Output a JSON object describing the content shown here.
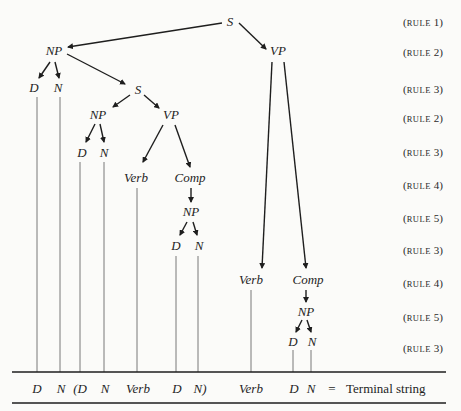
{
  "diagram": {
    "type": "phrase-structure-tree",
    "nodes": [
      {
        "id": "s1",
        "label": "S",
        "x": 230,
        "y": 22
      },
      {
        "id": "np1",
        "label": "NP",
        "x": 54,
        "y": 51
      },
      {
        "id": "vp1",
        "label": "VP",
        "x": 278,
        "y": 51
      },
      {
        "id": "d1",
        "label": "D",
        "x": 34,
        "y": 88
      },
      {
        "id": "n1",
        "label": "N",
        "x": 58,
        "y": 88
      },
      {
        "id": "s2",
        "label": "S",
        "x": 138,
        "y": 90
      },
      {
        "id": "np2",
        "label": "NP",
        "x": 98,
        "y": 115
      },
      {
        "id": "vp2",
        "label": "VP",
        "x": 171,
        "y": 115
      },
      {
        "id": "d2",
        "label": "D",
        "x": 82,
        "y": 153
      },
      {
        "id": "n2",
        "label": "N",
        "x": 104,
        "y": 153
      },
      {
        "id": "verb1",
        "label": "Verb",
        "x": 136,
        "y": 178
      },
      {
        "id": "comp1",
        "label": "Comp",
        "x": 190,
        "y": 178
      },
      {
        "id": "np3",
        "label": "NP",
        "x": 191,
        "y": 212
      },
      {
        "id": "d3",
        "label": "D",
        "x": 176,
        "y": 246
      },
      {
        "id": "n3",
        "label": "N",
        "x": 199,
        "y": 246
      },
      {
        "id": "verb2",
        "label": "Verb",
        "x": 251,
        "y": 280
      },
      {
        "id": "comp2",
        "label": "Comp",
        "x": 308,
        "y": 280
      },
      {
        "id": "np4",
        "label": "NP",
        "x": 306,
        "y": 312
      },
      {
        "id": "d4",
        "label": "D",
        "x": 293,
        "y": 342
      },
      {
        "id": "n4",
        "label": "N",
        "x": 312,
        "y": 342
      }
    ],
    "arrows": [
      {
        "from": "s1",
        "to": "np1",
        "x1": 222,
        "y1": 23,
        "x2": 68,
        "y2": 47
      },
      {
        "from": "s1",
        "to": "vp1",
        "x1": 239,
        "y1": 23,
        "x2": 266,
        "y2": 49
      },
      {
        "from": "np1",
        "to": "d1",
        "x1": 50,
        "y1": 62,
        "x2": 39,
        "y2": 78
      },
      {
        "from": "np1",
        "to": "n1",
        "x1": 55,
        "y1": 62,
        "x2": 59,
        "y2": 78
      },
      {
        "from": "np1",
        "to": "s2",
        "x1": 67,
        "y1": 54,
        "x2": 125,
        "y2": 84
      },
      {
        "from": "s2",
        "to": "np2",
        "x1": 130,
        "y1": 95,
        "x2": 113,
        "y2": 107
      },
      {
        "from": "s2",
        "to": "vp2",
        "x1": 144,
        "y1": 95,
        "x2": 159,
        "y2": 108
      },
      {
        "from": "np2",
        "to": "d2",
        "x1": 95,
        "y1": 124,
        "x2": 86,
        "y2": 142
      },
      {
        "from": "np2",
        "to": "n2",
        "x1": 100,
        "y1": 124,
        "x2": 104,
        "y2": 142
      },
      {
        "from": "vp2",
        "to": "verb1",
        "x1": 163,
        "y1": 125,
        "x2": 143,
        "y2": 162
      },
      {
        "from": "vp2",
        "to": "comp1",
        "x1": 175,
        "y1": 125,
        "x2": 190,
        "y2": 167
      },
      {
        "from": "comp1",
        "to": "np3",
        "x1": 191,
        "y1": 188,
        "x2": 191,
        "y2": 202
      },
      {
        "from": "np3",
        "to": "d3",
        "x1": 187,
        "y1": 222,
        "x2": 180,
        "y2": 235
      },
      {
        "from": "np3",
        "to": "n3",
        "x1": 193,
        "y1": 222,
        "x2": 197,
        "y2": 235
      },
      {
        "from": "vp1",
        "to": "verb2",
        "x1": 272,
        "y1": 62,
        "x2": 262,
        "y2": 268
      },
      {
        "from": "vp1",
        "to": "comp2",
        "x1": 284,
        "y1": 62,
        "x2": 306,
        "y2": 268
      },
      {
        "from": "comp2",
        "to": "np4",
        "x1": 306,
        "y1": 290,
        "x2": 306,
        "y2": 302
      },
      {
        "from": "np4",
        "to": "d4",
        "x1": 302,
        "y1": 320,
        "x2": 296,
        "y2": 332
      },
      {
        "from": "np4",
        "to": "n4",
        "x1": 307,
        "y1": 320,
        "x2": 311,
        "y2": 332
      }
    ],
    "drop_lines": [
      {
        "x": 37,
        "y1": 97,
        "y2": 372
      },
      {
        "x": 60,
        "y1": 97,
        "y2": 372
      },
      {
        "x": 80,
        "y1": 162,
        "y2": 372
      },
      {
        "x": 104,
        "y1": 162,
        "y2": 372
      },
      {
        "x": 137,
        "y1": 188,
        "y2": 372
      },
      {
        "x": 176,
        "y1": 256,
        "y2": 372
      },
      {
        "x": 198,
        "y1": 256,
        "y2": 372
      },
      {
        "x": 251,
        "y1": 290,
        "y2": 372
      },
      {
        "x": 293,
        "y1": 350,
        "y2": 372
      },
      {
        "x": 311,
        "y1": 350,
        "y2": 372
      }
    ],
    "rules": [
      {
        "label": "(RULE 1)",
        "y": 22
      },
      {
        "label": "(RULE 2)",
        "y": 52
      },
      {
        "label": "(RULE 3)",
        "y": 89
      },
      {
        "label": "(RULE 2)",
        "y": 118
      },
      {
        "label": "(RULE 3)",
        "y": 152
      },
      {
        "label": "(RULE 4)",
        "y": 185
      },
      {
        "label": "(RULE 5)",
        "y": 218
      },
      {
        "label": "(RULE 3)",
        "y": 250
      },
      {
        "label": "(RULE 4)",
        "y": 283
      },
      {
        "label": "(RULE 5)",
        "y": 317
      },
      {
        "label": "(RULE 3)",
        "y": 348
      }
    ],
    "terminal_string": {
      "tokens": [
        {
          "text": "D",
          "x": 37
        },
        {
          "text": "N",
          "x": 61
        },
        {
          "text": "(D",
          "x": 80
        },
        {
          "text": "N",
          "x": 105
        },
        {
          "text": "Verb",
          "x": 138
        },
        {
          "text": "D",
          "x": 177
        },
        {
          "text": "N)",
          "x": 200
        },
        {
          "text": "Verb",
          "x": 251
        },
        {
          "text": "D",
          "x": 294
        },
        {
          "text": "N",
          "x": 311
        }
      ],
      "equals": "=",
      "label": "Terminal string"
    },
    "colors": {
      "ink": "#1e1e1e",
      "background": "#fbfbf9",
      "drop_line": "#6a6a6a"
    }
  }
}
